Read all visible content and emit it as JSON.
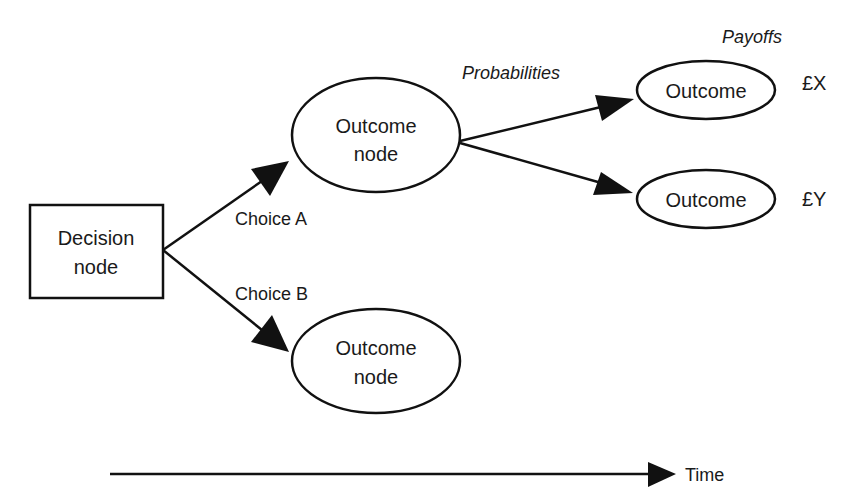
{
  "diagram": {
    "type": "decision-tree",
    "colors": {
      "stroke": "#111111",
      "text": "#1a1a1a",
      "background": "#ffffff"
    },
    "headers": {
      "probabilities": "Probabilities",
      "payoffs": "Payoffs"
    },
    "decision_node": {
      "line1": "Decision",
      "line2": "node"
    },
    "outcome_node_a": {
      "line1": "Outcome",
      "line2": "node"
    },
    "outcome_node_b": {
      "line1": "Outcome",
      "line2": "node"
    },
    "edges": {
      "choice_a": "Choice A",
      "choice_b": "Choice B"
    },
    "leaf_outcomes": [
      {
        "label": "Outcome",
        "payoff": "£X"
      },
      {
        "label": "Outcome",
        "payoff": "£Y"
      }
    ],
    "time_axis": {
      "label": "Time"
    }
  }
}
